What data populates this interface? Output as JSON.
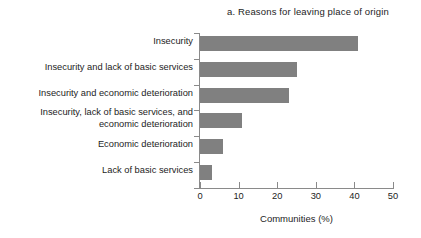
{
  "chart_data": {
    "type": "bar",
    "orientation": "horizontal",
    "title": "a. Reasons for leaving place of origin",
    "xlabel": "Communities (%)",
    "ylabel": "",
    "xlim": [
      0,
      50
    ],
    "xticks": [
      "0",
      "10",
      "20",
      "30",
      "40",
      "50"
    ],
    "grid": false,
    "legend": null,
    "bar_color": "#808080",
    "axis_color": "#8a8a8a",
    "text_color": "#1d1d1d",
    "categories": [
      "Insecurity",
      "Insecurity and lack of basic services",
      "Insecurity and economic deterioration",
      "Insecurity, lack of basic services, and economic deterioration",
      "Economic deterioration",
      "Lack of basic services"
    ],
    "values": [
      41,
      25,
      23,
      11,
      6,
      3
    ]
  }
}
